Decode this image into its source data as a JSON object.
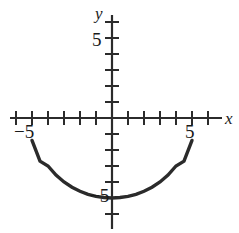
{
  "figure": {
    "title": "",
    "background_color": "#ffffff",
    "stroke_color": "#2b2b2b",
    "width": 239,
    "height": 233
  },
  "labels": {
    "x_axis": "x",
    "y_axis": "y",
    "y_five": "5",
    "x_neg_five": "−5",
    "x_five": "5",
    "y_neg_five": "−5"
  },
  "chart_data": {
    "type": "line",
    "title": "",
    "xlabel": "x",
    "ylabel": "y",
    "xlim": [
      -6.9,
      7.3
    ],
    "ylim": [
      -7.2,
      6.3
    ],
    "grid": false,
    "legend": null,
    "axes": {
      "origin_px": [
        112,
        118
      ],
      "pixels_per_unit": 16,
      "x_ticks": [
        -6,
        -5,
        -4,
        -3,
        -2,
        -1,
        1,
        2,
        3,
        4,
        5,
        6
      ],
      "y_ticks": [
        6,
        5,
        4,
        3,
        2,
        1,
        -1,
        -2,
        -3,
        -4,
        -5,
        -6,
        -7
      ],
      "x_tick_labels": {
        "-5": "−5",
        "5": "5"
      },
      "y_tick_labels": {
        "5": "5",
        "-5": "−5"
      },
      "x_axis_arrow": false,
      "y_axis_arrow": false
    },
    "curve": {
      "name": "lower semicircle",
      "equation": "y = -sqrt(25 - x^2)",
      "radius": 5,
      "center": [
        0,
        0
      ],
      "domain": [
        -5,
        5
      ],
      "range": [
        -5,
        0
      ],
      "endpoints": [
        [
          -5,
          -1.4
        ],
        [
          5,
          -1.4
        ]
      ],
      "vertex": [
        0,
        -5
      ],
      "x": [
        -5.0,
        -4.5,
        -4.0,
        -3.5,
        -3.0,
        -2.5,
        -2.0,
        -1.5,
        -1.0,
        -0.5,
        0.0,
        0.5,
        1.0,
        1.5,
        2.0,
        2.5,
        3.0,
        3.5,
        4.0,
        4.5,
        5.0
      ],
      "y": [
        -1.4,
        -2.7,
        -3.0,
        -3.57,
        -4.0,
        -4.33,
        -4.58,
        -4.77,
        -4.9,
        -4.97,
        -5.0,
        -4.97,
        -4.9,
        -4.77,
        -4.58,
        -4.33,
        -4.0,
        -3.57,
        -3.0,
        -2.7,
        -1.4
      ]
    }
  }
}
